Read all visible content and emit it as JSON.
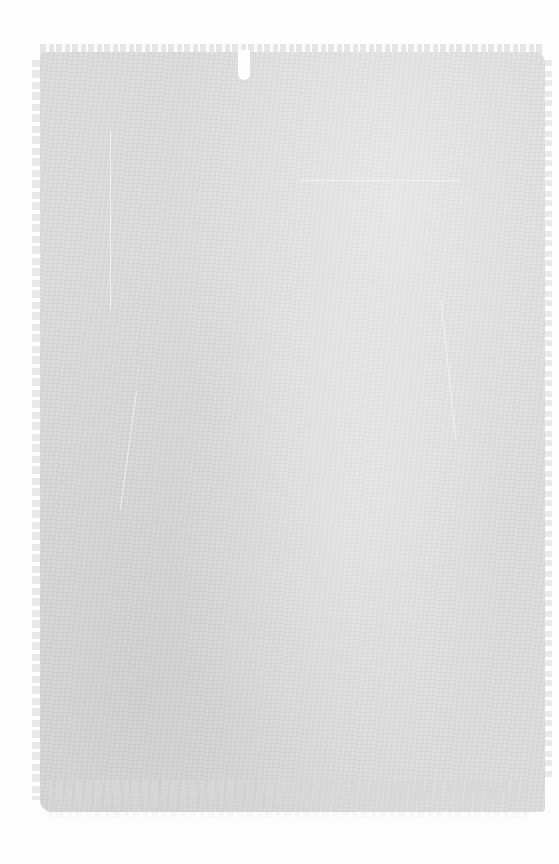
{
  "image": {
    "description": "Grunge gray paint-brushed texture on white background",
    "colors": {
      "background": "#fdfdfd",
      "texture_fill": "#dcdcdc"
    }
  }
}
